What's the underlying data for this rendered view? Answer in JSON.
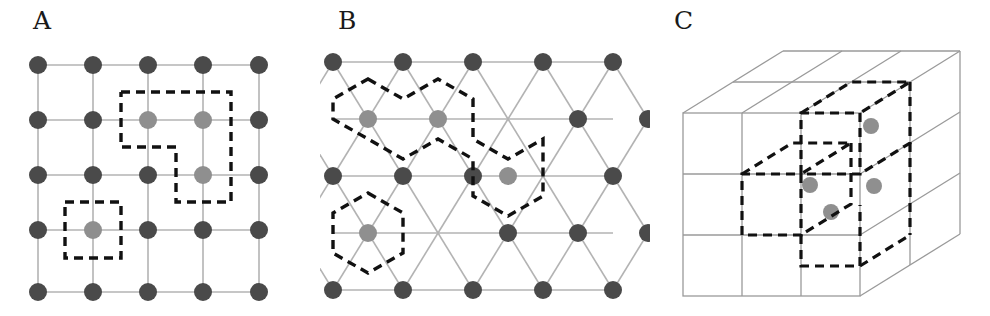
{
  "figure": {
    "background_color": "#ffffff",
    "width": 990,
    "height": 316
  },
  "style": {
    "node_dark_color": "#4a4a4a",
    "node_gray_color": "#8f8f8f",
    "bond_color": "#b3b3b3",
    "dashed_color": "#111111",
    "cube_edge_color": "#9a9a9a",
    "label_color": "#1a1a1a",
    "node_radius": 9,
    "node_radius_small": 8,
    "bond_width": 1.6,
    "dash_width": 3.4,
    "dash_pattern": "9 6"
  },
  "panels": [
    {
      "id": "panel-a",
      "label": "A",
      "label_x": 33,
      "label_y": 8,
      "lattice_type": "square",
      "rows": 5,
      "cols": 5,
      "x_positions": [
        38,
        93,
        148,
        203,
        259
      ],
      "y_positions": [
        65,
        120,
        175,
        230,
        292
      ],
      "gray_node_cells": [
        [
          1,
          2
        ],
        [
          1,
          3
        ],
        [
          2,
          3
        ],
        [
          3,
          1
        ]
      ],
      "regions": [
        {
          "name": "single-unit-cell",
          "kind": "square",
          "encloses": 1,
          "points": "65,202 121,202 121,258 65,258 65,202"
        },
        {
          "name": "staircase-supercell",
          "kind": "L-shaped",
          "encloses": 3,
          "points": "121,92 231,92 231,202 176,202 176,147 121,147 121,92"
        }
      ]
    },
    {
      "id": "panel-b",
      "label": "B",
      "label_x": 18,
      "label_y": 8,
      "lattice_type": "triangular",
      "rows": 5,
      "row_y": [
        62,
        119,
        176,
        233,
        290
      ],
      "row_a_x": [
        333,
        403,
        473,
        543,
        613
      ],
      "row_b_x": [
        298,
        368,
        438,
        508,
        578,
        648
      ],
      "gray_nodes": [
        {
          "x": 368,
          "y": 119
        },
        {
          "x": 438,
          "y": 119
        },
        {
          "x": 508,
          "y": 176
        },
        {
          "x": 368,
          "y": 233
        }
      ],
      "regions": [
        {
          "name": "wigner-seitz-hexagon",
          "kind": "hexagon",
          "encloses": 1,
          "center_x": 368,
          "center_y": 233,
          "radius": 40
        },
        {
          "name": "three-cell-supercell",
          "kind": "hexagon-cluster",
          "encloses": 3
        }
      ]
    },
    {
      "id": "panel-c",
      "label": "C",
      "label_x": 24,
      "label_y": 8,
      "lattice_type": "cubic-3d",
      "projection": "oblique",
      "cols": 3,
      "rows": 3,
      "depth": 2,
      "front_left": 683,
      "front_top": 113,
      "cell_w": 59,
      "cell_h": 61,
      "depth_dx": 50,
      "depth_dy": -31,
      "gray_nodes": [
        {
          "x": 871,
          "y": 126
        },
        {
          "x": 810,
          "y": 185
        },
        {
          "x": 874,
          "y": 186
        },
        {
          "x": 831,
          "y": 212
        }
      ],
      "regions": [
        {
          "name": "cubic-unit-cell-outline",
          "kind": "cube",
          "encloses": 4
        }
      ]
    }
  ]
}
